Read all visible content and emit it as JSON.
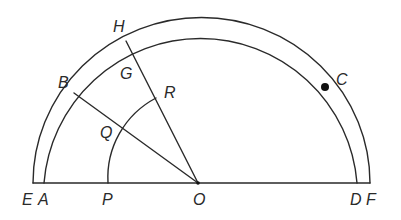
{
  "diagram": {
    "type": "geometric-construction",
    "stroke_color": "#2a2a2a",
    "background": "#ffffff",
    "baseline": {
      "from": "E",
      "to": "F",
      "y": 183
    },
    "points": {
      "E": {
        "label": "E",
        "x": 33,
        "y": 183,
        "lx": 22,
        "ly": 205
      },
      "A": {
        "label": "A",
        "x": 44,
        "y": 183,
        "lx": 38,
        "ly": 205
      },
      "P": {
        "label": "P",
        "x": 108,
        "y": 183,
        "lx": 102,
        "ly": 205
      },
      "O": {
        "label": "O",
        "x": 198,
        "y": 183,
        "lx": 193,
        "ly": 205
      },
      "D": {
        "label": "D",
        "x": 357,
        "y": 183,
        "lx": 350,
        "ly": 205
      },
      "F": {
        "label": "F",
        "x": 370,
        "y": 183,
        "lx": 366,
        "ly": 205
      },
      "B": {
        "label": "B",
        "x": 74,
        "y": 93,
        "lx": 58,
        "ly": 88
      },
      "Q": {
        "label": "Q",
        "x": 124,
        "y": 126,
        "lx": 100,
        "ly": 138
      },
      "H": {
        "label": "H",
        "x": 126,
        "y": 41,
        "lx": 113,
        "ly": 32
      },
      "G": {
        "label": "G",
        "x": 133,
        "y": 54,
        "lx": 120,
        "ly": 79
      },
      "R": {
        "label": "R",
        "x": 156,
        "y": 98,
        "lx": 164,
        "ly": 98
      },
      "C": {
        "label": "C",
        "x": 325,
        "y": 87,
        "lx": 336,
        "ly": 85
      }
    },
    "arcs": [
      {
        "name": "outer-arc-EHF",
        "path": "M 33 183 A 168 165 0 0 1 370 183"
      },
      {
        "name": "inner-arc-ABCD",
        "path": "M 44 183 A 157 157 0 0 1 357 183"
      },
      {
        "name": "small-arc-PQR",
        "path": "M 108 183 A 90 90 0 0 1 156 98"
      }
    ],
    "segments": [
      {
        "name": "segment-EF",
        "from": "E",
        "to": "F"
      },
      {
        "name": "segment-OB",
        "from": "O",
        "to": "B"
      },
      {
        "name": "segment-OH",
        "from": "O",
        "to": "H"
      }
    ]
  }
}
